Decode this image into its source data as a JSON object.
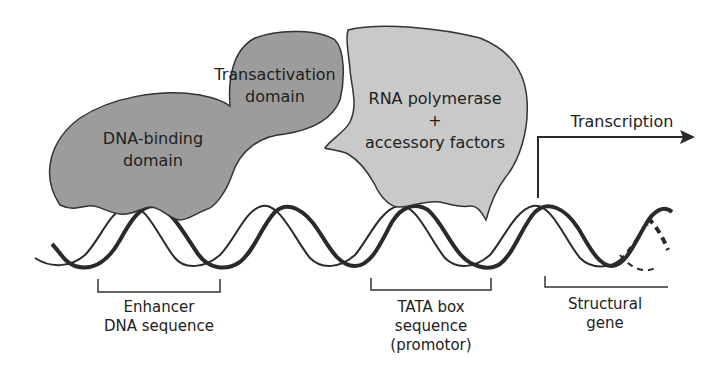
{
  "diagram": {
    "title": "",
    "proteins": {
      "activator": {
        "dna_binding_domain": {
          "label_line1": "DNA-binding",
          "label_line2": "domain"
        },
        "transactivation_domain": {
          "label_line1": "Transactivation",
          "label_line2": "domain"
        },
        "fill_color": "#9c9c9c"
      },
      "polymerase": {
        "label_line1": "RNA polymerase",
        "label_line2": "+",
        "label_line3": "accessory factors",
        "fill_color": "#c9c9c9"
      }
    },
    "arrow": {
      "label": "Transcription"
    },
    "regions": [
      {
        "line1": "Enhancer",
        "line2": "DNA sequence"
      },
      {
        "line1": "TATA box",
        "line2": "sequence",
        "line3": "(promotor)"
      },
      {
        "line1": "Structural",
        "line2": "gene"
      }
    ],
    "colors": {
      "strand": "#2a2a2a",
      "outline": "#333333",
      "text": "#222222"
    }
  }
}
